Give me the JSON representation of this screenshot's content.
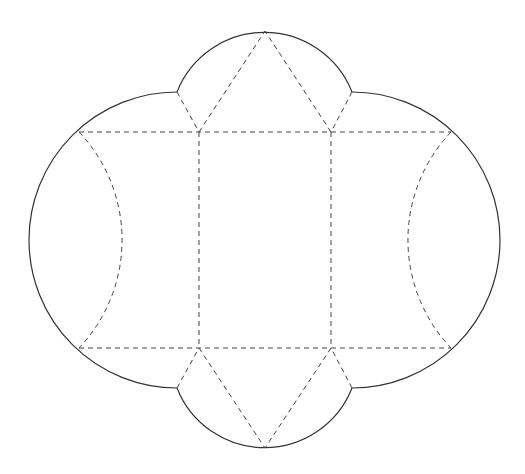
{
  "diagram": {
    "type": "box-net-template",
    "colors": {
      "background": "#ffffff",
      "cut_line": "#333333",
      "fold_line": "#444444"
    },
    "line_styles": {
      "cut": "solid",
      "fold": "dashed"
    },
    "panels": [
      {
        "name": "center-panel",
        "shape": "rectangle"
      },
      {
        "name": "left-panel",
        "shape": "curved-side"
      },
      {
        "name": "right-panel",
        "shape": "curved-side"
      },
      {
        "name": "top-tab",
        "shape": "triangle-with-arc"
      },
      {
        "name": "bottom-tab",
        "shape": "triangle-with-arc"
      },
      {
        "name": "left-flap",
        "shape": "arc-segment"
      },
      {
        "name": "right-flap",
        "shape": "arc-segment"
      }
    ]
  }
}
